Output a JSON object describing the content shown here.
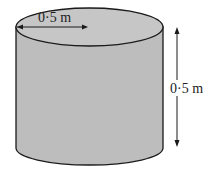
{
  "diagram": {
    "shape": "cylinder",
    "radius_label": "0·5 m",
    "height_label": "0·5 m",
    "colors": {
      "body": "#bdbdbd",
      "top": "#c4c4c4",
      "outline": "#1a1a1a"
    }
  }
}
